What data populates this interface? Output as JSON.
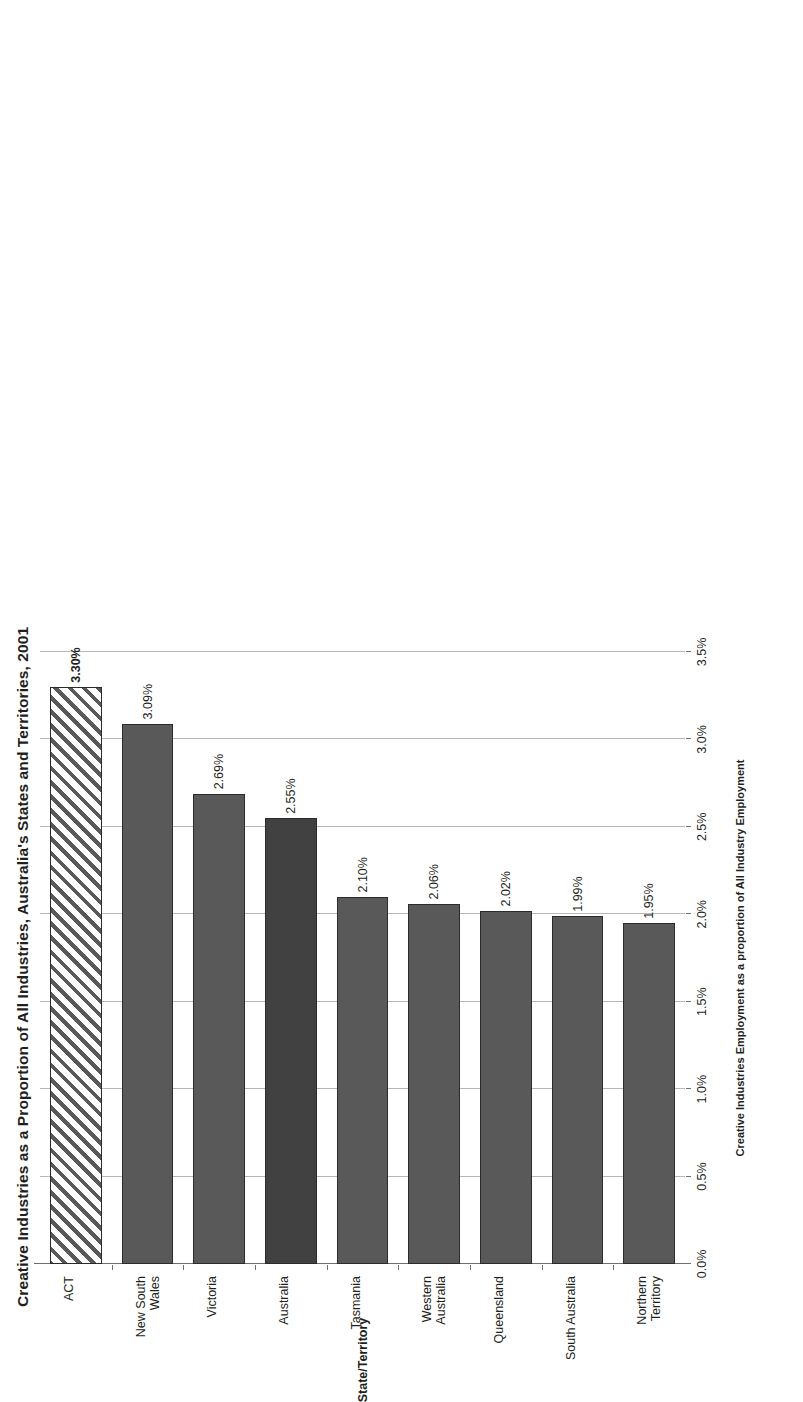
{
  "chart_data": {
    "type": "bar",
    "orientation": "horizontal",
    "title": "Creative Industries as a Proportion of All Industries, Australia's States and Territories, 2001",
    "xlabel": "State/Territory",
    "ylabel": "Creative Industries Employment as a proportion of All Industry Employment",
    "categories": [
      "ACT",
      "New South Wales",
      "Victoria",
      "Australia",
      "Tasmania",
      "Western Australia",
      "Queensland",
      "South Australia",
      "Northern Territory"
    ],
    "category_labels_wrapped": [
      "ACT",
      "New South\nWales",
      "Victoria",
      "Australia",
      "Tasmania",
      "Western\nAustralia",
      "Queensland",
      "South Australia",
      "Northern\nTerritory"
    ],
    "values": [
      3.3,
      3.09,
      2.69,
      2.55,
      2.1,
      2.06,
      2.02,
      1.99,
      1.95
    ],
    "value_labels": [
      "3.30%",
      "3.09%",
      "2.69%",
      "2.55%",
      "2.10%",
      "2.06%",
      "2.02%",
      "1.99%",
      "1.95%"
    ],
    "bar_styles": [
      "hatched",
      "solid",
      "solid",
      "highlight",
      "solid",
      "solid",
      "solid",
      "solid",
      "solid"
    ],
    "label_bold": [
      true,
      false,
      false,
      false,
      false,
      false,
      false,
      false,
      false
    ],
    "ylim": [
      0.0,
      3.5
    ],
    "ytick_labels": [
      "0.0%",
      "0.5%",
      "1.0%",
      "1.5%",
      "2.0%",
      "2.5%",
      "3.0%",
      "3.5%"
    ],
    "ytick_values": [
      0.0,
      0.5,
      1.0,
      1.5,
      2.0,
      2.5,
      3.0,
      3.5
    ],
    "grid": true,
    "legend": null,
    "colors": {
      "bar_solid": "#595959",
      "bar_highlight": "#414141",
      "bar_border": "#2b2b2b",
      "gridline": "#b8b8b8",
      "axis": "#6f6f6f",
      "text": "#231f20",
      "background": "#ffffff"
    }
  }
}
